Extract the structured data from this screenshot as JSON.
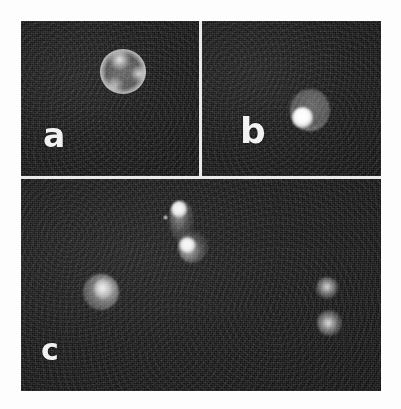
{
  "figure": {
    "background_color": "#ffffff",
    "plate_background_color": "#0b0b0b",
    "gutter_color": "#e9e9e9",
    "label_color": "#f2f2f2"
  },
  "panels": [
    {
      "id": "a",
      "label": "a",
      "caption_pattern": "ring",
      "objects": [
        {
          "name": "ring-stained-cell",
          "shape": "circle",
          "cx": 102,
          "cy": 50,
          "diameter": 46,
          "brightness": "bright-rim-dim-center"
        }
      ]
    },
    {
      "id": "b",
      "label": "b",
      "caption_pattern": "cap",
      "objects": [
        {
          "name": "capped-cell-body",
          "shape": "circle",
          "cx": 108,
          "cy": 89,
          "diameter": 40,
          "brightness": "dim"
        },
        {
          "name": "fluorescent-cap",
          "shape": "circle",
          "cx": 100,
          "cy": 96,
          "diameter": 21,
          "brightness": "very-bright"
        }
      ]
    },
    {
      "id": "c",
      "label": "c",
      "caption_pattern": "multiple-capped-cells",
      "objects": [
        {
          "name": "capped-cell-left",
          "shape": "circle",
          "cx": 80,
          "cy": 113,
          "diameter": 36,
          "brightness": "bright"
        },
        {
          "name": "capped-cell-upper",
          "shape": "teardrop",
          "cx": 160,
          "cy": 43,
          "diameter": 25,
          "brightness": "bright-cap"
        },
        {
          "name": "capped-cell-middle",
          "shape": "teardrop",
          "cx": 172,
          "cy": 68,
          "diameter": 30,
          "brightness": "bright-cap"
        },
        {
          "name": "capped-cell-right-upper",
          "shape": "irregular",
          "cx": 306,
          "cy": 109,
          "diameter": 22,
          "brightness": "bright"
        },
        {
          "name": "capped-cell-right-lower",
          "shape": "irregular",
          "cx": 308,
          "cy": 144,
          "diameter": 25,
          "brightness": "bright"
        },
        {
          "name": "background-speck",
          "shape": "point",
          "cx": 144,
          "cy": 38,
          "diameter": 5,
          "brightness": "faint"
        }
      ]
    }
  ]
}
